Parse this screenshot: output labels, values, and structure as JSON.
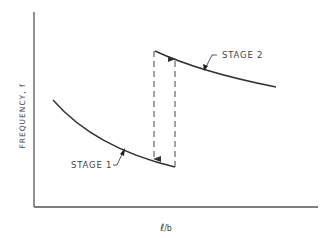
{
  "diagram": {
    "type": "schematic-curve-plot",
    "y_axis_label": "FREQUENCY, f",
    "x_axis_label_main": "ℓ",
    "x_axis_label_sub": "/b",
    "curves": [
      {
        "name": "stage-1",
        "label": "STAGE 1",
        "trend": "decreasing"
      },
      {
        "name": "stage-2",
        "label": "STAGE 2",
        "trend": "decreasing"
      }
    ],
    "transitions": [
      {
        "name": "jump-down",
        "from": "STAGE 2",
        "to": "STAGE 1",
        "style": "dashed",
        "arrow": "down"
      },
      {
        "name": "jump-up",
        "from": "STAGE 1",
        "to": "STAGE 2",
        "style": "dashed",
        "arrow": "up"
      }
    ],
    "colors": {
      "line": "#333333",
      "text": "#444444",
      "background": "#ffffff"
    }
  }
}
